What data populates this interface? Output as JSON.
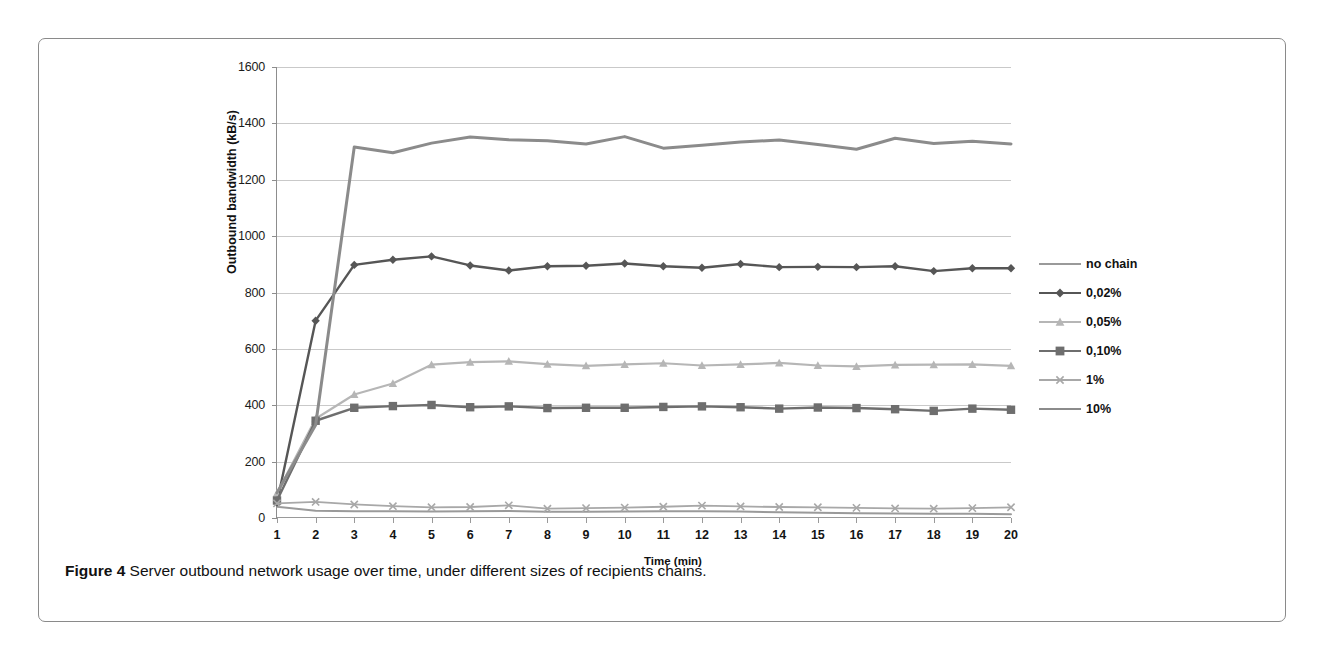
{
  "figure": {
    "caption_prefix": "Figure 4",
    "caption_text": "Server outbound network usage over time, under different sizes of recipients chains."
  },
  "chart_data": {
    "type": "line",
    "title": "",
    "xlabel": "Time (min)",
    "ylabel": "Outbound bandwidth (kB/s)",
    "x": [
      1,
      2,
      3,
      4,
      5,
      6,
      7,
      8,
      9,
      10,
      11,
      12,
      13,
      14,
      15,
      16,
      17,
      18,
      19,
      20
    ],
    "xtick_labels": [
      "1",
      "2",
      "3",
      "4",
      "5",
      "6",
      "7",
      "8",
      "9",
      "10",
      "11",
      "12",
      "13",
      "14",
      "15",
      "16",
      "17",
      "18",
      "19",
      "20"
    ],
    "ytick_labels": [
      "0",
      "200",
      "400",
      "600",
      "800",
      "1000",
      "1200",
      "1400",
      "1600"
    ],
    "yticks": [
      0,
      200,
      400,
      600,
      800,
      1000,
      1200,
      1400,
      1600
    ],
    "xlim": [
      1,
      20
    ],
    "ylim": [
      0,
      1600
    ],
    "grid": "horizontal",
    "legend_position": "right",
    "series": [
      {
        "name": "no chain",
        "color": "#9a9a9a",
        "marker": "none",
        "width": 2,
        "values": [
          40,
          26,
          24,
          24,
          23,
          24,
          25,
          22,
          22,
          23,
          24,
          24,
          23,
          20,
          19,
          17,
          16,
          15,
          15,
          13
        ]
      },
      {
        "name": "0,02%",
        "color": "#565656",
        "marker": "diamond",
        "width": 2.4,
        "values": [
          55,
          700,
          898,
          916,
          928,
          896,
          878,
          893,
          895,
          903,
          893,
          888,
          901,
          890,
          891,
          890,
          893,
          876,
          886,
          886
        ]
      },
      {
        "name": "0,05%",
        "color": "#b6b6b6",
        "marker": "triangle",
        "width": 2.2,
        "values": [
          88,
          352,
          438,
          477,
          544,
          553,
          556,
          546,
          540,
          545,
          549,
          541,
          545,
          550,
          541,
          538,
          543,
          544,
          545,
          540
        ]
      },
      {
        "name": "0,10%",
        "color": "#6e6e6e",
        "marker": "square",
        "width": 2.4,
        "values": [
          62,
          345,
          391,
          397,
          401,
          393,
          396,
          390,
          391,
          391,
          394,
          396,
          393,
          388,
          392,
          390,
          386,
          380,
          388,
          384
        ]
      },
      {
        "name": "1%",
        "color": "#a8a8a8",
        "marker": "cross",
        "width": 1.8,
        "values": [
          52,
          57,
          48,
          42,
          38,
          39,
          45,
          33,
          35,
          37,
          40,
          44,
          41,
          39,
          38,
          36,
          34,
          33,
          35,
          38
        ]
      },
      {
        "name": "10%",
        "color": "#8b8b8b",
        "marker": "none",
        "width": 3,
        "values": [
          90,
          330,
          1316,
          1296,
          1330,
          1352,
          1342,
          1338,
          1327,
          1353,
          1312,
          1322,
          1334,
          1341,
          1325,
          1308,
          1347,
          1329,
          1337,
          1327
        ]
      }
    ]
  }
}
